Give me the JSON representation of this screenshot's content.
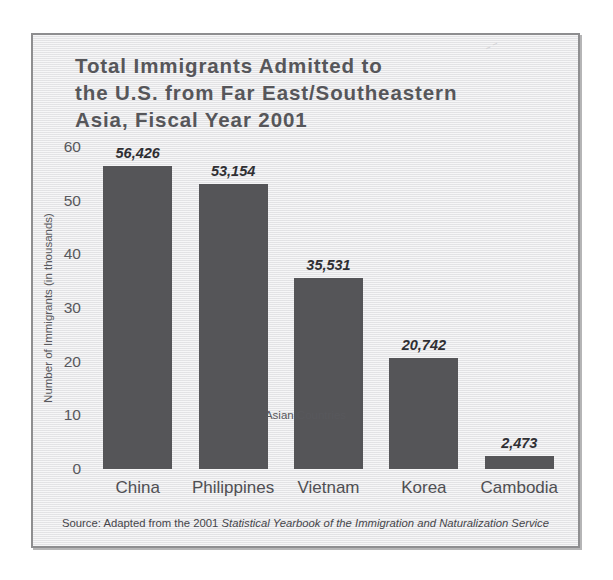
{
  "chart_data": {
    "type": "bar",
    "title": "Total Immigrants Admitted to the U.S. from Far East/Southeastern Asia, Fiscal Year 2001",
    "title_lines": [
      "Total Immigrants Admitted to",
      "the U.S. from Far East/Southeastern",
      "Asia, Fiscal Year 2001"
    ],
    "subtitle": "",
    "xlabel": "Asian Countries",
    "ylabel": "Number of Immigrants (in thousands)",
    "categories": [
      "China",
      "Philippines",
      "Vietnam",
      "Korea",
      "Cambodia"
    ],
    "values": [
      56426,
      53154,
      35531,
      20742,
      2473
    ],
    "value_labels": [
      "56,426",
      "53,154",
      "35,531",
      "20,742",
      "2,473"
    ],
    "ylim": [
      0,
      60000
    ],
    "y_ticks": [
      60,
      50,
      40,
      30,
      20,
      10,
      0
    ],
    "y_tick_labels": [
      "60",
      "50",
      "40",
      "30",
      "20",
      "10",
      "0"
    ],
    "y_tick_unit": "thousands",
    "grid": false,
    "legend": false,
    "bar_color": "#555558",
    "background_color": "#ececed",
    "text_color": "#56565a"
  },
  "source": {
    "prefix": "Source: Adapted from the 2001 ",
    "italic": "Statistical Yearbook of the Immigration and Naturalization Service",
    "full": "Source: Adapted from the 2001 Statistical Yearbook of the Immigration and Naturalization Service"
  }
}
